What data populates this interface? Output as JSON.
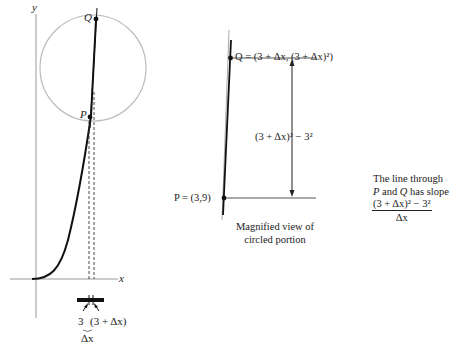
{
  "figure": {
    "left_graph": {
      "y_axis_label": "y",
      "x_axis_label": "x",
      "point_p_label": "P",
      "point_q_label": "Q",
      "tick_label_3": "3",
      "tick_label_3_plus_dx": "(3 + Δx)",
      "delta_x_label": "Δx"
    },
    "magnified_view": {
      "q_label": "Q = (3 + Δx, (3 + Δx)²)",
      "p_label": "P = (3,9)",
      "vertical_difference_label": "(3 + Δx)² − 3²",
      "caption_line1": "Magnified view of",
      "caption_line2": "circled portion"
    },
    "slope_note": {
      "line1": "The line through",
      "line2_p": "P",
      "line2_mid": " and ",
      "line2_q": "Q",
      "line2_end": " has slope",
      "numerator": "(3 + Δx)² − 3²",
      "denominator": "Δx"
    }
  }
}
